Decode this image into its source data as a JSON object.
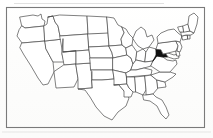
{
  "figure": {
    "kind": "map",
    "title": "",
    "caption": "",
    "frame": {
      "visible": true,
      "color": "#7a7a7a",
      "x": 6,
      "y": 7,
      "width": 199,
      "height": 121
    },
    "background_color": "#fefefe",
    "outline_color": "#4a4a4a",
    "highlight_color": "#111111"
  },
  "map": {
    "region": "Contiguous United States",
    "projection_note": "simplified state outlines",
    "highlighted_states": [
      "West Virginia"
    ],
    "highlight_fill": "#111111",
    "unhighlighted_fill": "#ffffff",
    "states": [
      {
        "code": "WA",
        "name": "Washington",
        "highlighted": false
      },
      {
        "code": "OR",
        "name": "Oregon",
        "highlighted": false
      },
      {
        "code": "CA",
        "name": "California",
        "highlighted": false
      },
      {
        "code": "NV",
        "name": "Nevada",
        "highlighted": false
      },
      {
        "code": "ID",
        "name": "Idaho",
        "highlighted": false
      },
      {
        "code": "MT",
        "name": "Montana",
        "highlighted": false
      },
      {
        "code": "WY",
        "name": "Wyoming",
        "highlighted": false
      },
      {
        "code": "UT",
        "name": "Utah",
        "highlighted": false
      },
      {
        "code": "AZ",
        "name": "Arizona",
        "highlighted": false
      },
      {
        "code": "NM",
        "name": "New Mexico",
        "highlighted": false
      },
      {
        "code": "CO",
        "name": "Colorado",
        "highlighted": false
      },
      {
        "code": "ND",
        "name": "North Dakota",
        "highlighted": false
      },
      {
        "code": "SD",
        "name": "South Dakota",
        "highlighted": false
      },
      {
        "code": "NE",
        "name": "Nebraska",
        "highlighted": false
      },
      {
        "code": "KS",
        "name": "Kansas",
        "highlighted": false
      },
      {
        "code": "OK",
        "name": "Oklahoma",
        "highlighted": false
      },
      {
        "code": "TX",
        "name": "Texas",
        "highlighted": false
      },
      {
        "code": "MN",
        "name": "Minnesota",
        "highlighted": false
      },
      {
        "code": "IA",
        "name": "Iowa",
        "highlighted": false
      },
      {
        "code": "MO",
        "name": "Missouri",
        "highlighted": false
      },
      {
        "code": "AR",
        "name": "Arkansas",
        "highlighted": false
      },
      {
        "code": "LA",
        "name": "Louisiana",
        "highlighted": false
      },
      {
        "code": "WI",
        "name": "Wisconsin",
        "highlighted": false
      },
      {
        "code": "IL",
        "name": "Illinois",
        "highlighted": false
      },
      {
        "code": "MI",
        "name": "Michigan",
        "highlighted": false
      },
      {
        "code": "IN",
        "name": "Indiana",
        "highlighted": false
      },
      {
        "code": "OH",
        "name": "Ohio",
        "highlighted": false
      },
      {
        "code": "KY",
        "name": "Kentucky",
        "highlighted": false
      },
      {
        "code": "TN",
        "name": "Tennessee",
        "highlighted": false
      },
      {
        "code": "MS",
        "name": "Mississippi",
        "highlighted": false
      },
      {
        "code": "AL",
        "name": "Alabama",
        "highlighted": false
      },
      {
        "code": "GA",
        "name": "Georgia",
        "highlighted": false
      },
      {
        "code": "FL",
        "name": "Florida",
        "highlighted": false
      },
      {
        "code": "SC",
        "name": "South Carolina",
        "highlighted": false
      },
      {
        "code": "NC",
        "name": "North Carolina",
        "highlighted": false
      },
      {
        "code": "VA",
        "name": "Virginia",
        "highlighted": false
      },
      {
        "code": "WV",
        "name": "West Virginia",
        "highlighted": true
      },
      {
        "code": "MD",
        "name": "Maryland",
        "highlighted": false
      },
      {
        "code": "DE",
        "name": "Delaware",
        "highlighted": false
      },
      {
        "code": "PA",
        "name": "Pennsylvania",
        "highlighted": false
      },
      {
        "code": "NJ",
        "name": "New Jersey",
        "highlighted": false
      },
      {
        "code": "NY",
        "name": "New York",
        "highlighted": false
      },
      {
        "code": "CT",
        "name": "Connecticut",
        "highlighted": false
      },
      {
        "code": "RI",
        "name": "Rhode Island",
        "highlighted": false
      },
      {
        "code": "MA",
        "name": "Massachusetts",
        "highlighted": false
      },
      {
        "code": "VT",
        "name": "Vermont",
        "highlighted": false
      },
      {
        "code": "NH",
        "name": "New Hampshire",
        "highlighted": false
      },
      {
        "code": "ME",
        "name": "Maine",
        "highlighted": false
      }
    ]
  }
}
